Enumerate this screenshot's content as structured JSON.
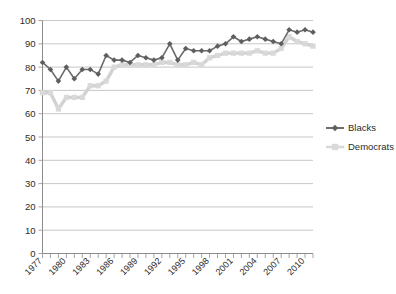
{
  "chart_data": {
    "type": "line",
    "title": "",
    "subtitle": "",
    "xlabel": "",
    "ylabel": "",
    "xlim": [
      1977,
      2011
    ],
    "ylim": [
      0,
      100
    ],
    "grid": true,
    "legend_position": "right",
    "y_ticks": [
      0,
      10,
      20,
      30,
      40,
      50,
      60,
      70,
      80,
      90,
      100
    ],
    "x_tick_labels": [
      "1977",
      "1980",
      "1983",
      "1986",
      "1989",
      "1992",
      "1995",
      "1998",
      "2001",
      "2004",
      "2007",
      "2010"
    ],
    "x": [
      1977,
      1978,
      1979,
      1980,
      1981,
      1982,
      1983,
      1984,
      1985,
      1986,
      1987,
      1988,
      1989,
      1990,
      1991,
      1992,
      1993,
      1994,
      1995,
      1996,
      1997,
      1998,
      1999,
      2000,
      2001,
      2002,
      2003,
      2004,
      2005,
      2006,
      2007,
      2008,
      2009,
      2010,
      2011
    ],
    "series": [
      {
        "name": "Blacks",
        "color": "#5e5e5e",
        "marker": "diamond",
        "values": [
          82,
          79,
          74,
          80,
          75,
          79,
          79,
          77,
          85,
          83,
          83,
          82,
          85,
          84,
          83,
          84,
          90,
          83,
          88,
          87,
          87,
          87,
          89,
          90,
          93,
          91,
          92,
          93,
          92,
          91,
          90,
          96,
          95,
          96,
          95
        ]
      },
      {
        "name": "Democrats",
        "color": "#d9d9d9",
        "marker": "square",
        "values": [
          69,
          69,
          62,
          67,
          67,
          67,
          72,
          72,
          74,
          80,
          81,
          81,
          81,
          81,
          81,
          82,
          82,
          81,
          81,
          82,
          81,
          84,
          85,
          86,
          86,
          86,
          86,
          87,
          86,
          86,
          88,
          93,
          91,
          90,
          89
        ]
      }
    ]
  },
  "legend": {
    "items": [
      {
        "label": "Blacks",
        "color": "#5e5e5e",
        "marker": "diamond"
      },
      {
        "label": "Democrats",
        "color": "#d9d9d9",
        "marker": "square"
      }
    ]
  }
}
